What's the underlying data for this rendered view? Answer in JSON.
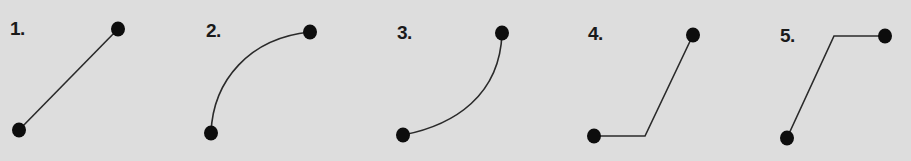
{
  "colors": {
    "background": "#dddddd",
    "stroke": "#2a2a2a",
    "dot": "#0d0d0d",
    "label": "#1a1a1a"
  },
  "panels": [
    {
      "label": "1.",
      "type": "straight-line",
      "label_pos": [
        10,
        19
      ],
      "start": [
        19,
        130
      ],
      "end": [
        118,
        29
      ],
      "path": "M19 130 L118 29"
    },
    {
      "label": "2.",
      "type": "convex-arc",
      "label_pos": [
        206,
        21
      ],
      "start": [
        211,
        133
      ],
      "end": [
        310,
        32
      ],
      "path": "M211 133 C213 80 250 38 310 32"
    },
    {
      "label": "3.",
      "type": "concave-arc",
      "label_pos": [
        397,
        23
      ],
      "start": [
        403,
        135
      ],
      "end": [
        502,
        33
      ],
      "path": "M403 135 C455 125 500 95 502 33"
    },
    {
      "label": "4.",
      "type": "horizontal-then-diagonal",
      "label_pos": [
        588,
        24
      ],
      "start": [
        594,
        136
      ],
      "end": [
        693,
        35
      ],
      "path": "M594 136 L645 136 L693 35"
    },
    {
      "label": "5.",
      "type": "diagonal-then-horizontal",
      "label_pos": [
        780,
        26
      ],
      "start": [
        787,
        138
      ],
      "end": [
        885,
        36
      ],
      "path": "M787 138 L834 36 L885 36"
    }
  ]
}
